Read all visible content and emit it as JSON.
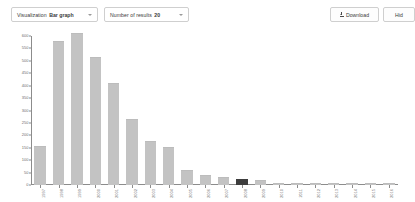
{
  "toolbar": {
    "visualization": {
      "label": "Visualization",
      "value": "Bar graph",
      "caret": "chevron-down-icon"
    },
    "number_of_results": {
      "label": "Number of results",
      "value": "20",
      "caret": "chevron-down-icon"
    },
    "download_button": {
      "label": "Download",
      "icon": "download-icon"
    },
    "hide_button": {
      "label": "Hid"
    }
  },
  "chart_data": {
    "type": "bar",
    "title": "",
    "xlabel": "",
    "ylabel": "",
    "ylim": [
      0,
      600
    ],
    "grid": false,
    "legend": null,
    "yticks": [
      0,
      50,
      100,
      150,
      200,
      250,
      300,
      350,
      400,
      450,
      500,
      550,
      600
    ],
    "ytick_labels": [
      "0",
      "50",
      "100",
      "150",
      "200",
      "250",
      "300",
      "350",
      "400",
      "450",
      "500",
      "550",
      "600"
    ],
    "categories": [
      "1997",
      "1998",
      "1999",
      "2000",
      "2001",
      "2002",
      "2003",
      "2004",
      "2005",
      "2006",
      "2007",
      "2008",
      "2009",
      "2010",
      "2011",
      "2012",
      "2013",
      "2014",
      "2015",
      "2016"
    ],
    "values": [
      152,
      575,
      610,
      510,
      405,
      260,
      175,
      148,
      55,
      38,
      30,
      22,
      18,
      5,
      4,
      3,
      3,
      2,
      2,
      2
    ],
    "highlight_index": 11,
    "bar_color": "#c3c3c3",
    "highlight_color": "#3d3d3d",
    "axis_color": "#8c8c8c"
  }
}
